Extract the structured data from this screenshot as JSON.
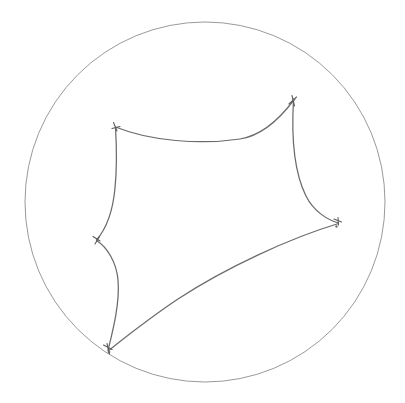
{
  "figure": {
    "background_color": "#ffffff",
    "width": 405,
    "height": 403,
    "style": "hand-drawn line sketch, no text labels"
  },
  "boundary": {
    "name": "ideal-boundary-circle",
    "center_x": 205,
    "center_y": 202,
    "radius": 180,
    "stroke_color": "#9a9a9a",
    "stroke_width": 1,
    "fill": "none"
  },
  "polygon": {
    "name": "hyperbolic-pentagon",
    "sides": 5,
    "edge_stroke_color": "#6b6b6b",
    "edge_stroke_width": 1.25,
    "edge_type": "geodesic-arc",
    "curvature": "concave-inward",
    "vertices": [
      {
        "id": "v1",
        "label": "top-left-vertex",
        "x": 116,
        "y": 128,
        "on_boundary": false
      },
      {
        "id": "v2",
        "label": "top-right-vertex",
        "x": 293,
        "y": 100,
        "on_boundary": false
      },
      {
        "id": "v3",
        "label": "right-vertex",
        "x": 338,
        "y": 223,
        "on_boundary": false
      },
      {
        "id": "v4",
        "label": "bottom-vertex",
        "x": 108,
        "y": 350,
        "on_boundary": true
      },
      {
        "id": "v5",
        "label": "left-vertex",
        "x": 97,
        "y": 240,
        "on_boundary": false
      }
    ],
    "edges": [
      {
        "id": "e1",
        "label": "top-edge",
        "from": "v1",
        "to": "v2",
        "bows": "inward-down"
      },
      {
        "id": "e2",
        "label": "right-upper-edge",
        "from": "v2",
        "to": "v3",
        "bows": "inward-left"
      },
      {
        "id": "e3",
        "label": "lower-right-edge",
        "from": "v3",
        "to": "v4",
        "bows": "inward-up"
      },
      {
        "id": "e4",
        "label": "lower-left-edge",
        "from": "v4",
        "to": "v5",
        "bows": "inward-right"
      },
      {
        "id": "e5",
        "label": "upper-left-edge",
        "from": "v5",
        "to": "v1",
        "bows": "inward-right"
      }
    ]
  },
  "vertex_marks": {
    "name": "vertex-overshoot-ticks",
    "description": "small crossing pen strokes where arcs overshoot at each corner",
    "stroke_color": "#5d5d5d"
  }
}
